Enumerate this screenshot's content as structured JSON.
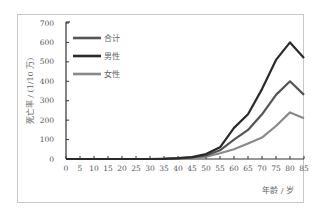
{
  "chart_data": {
    "type": "line",
    "title": "",
    "xlabel": "年龄 / 岁",
    "ylabel": "死亡率 / (1/10 万)",
    "x": [
      0,
      5,
      10,
      15,
      20,
      25,
      30,
      35,
      40,
      45,
      50,
      55,
      60,
      65,
      70,
      75,
      80,
      85
    ],
    "xticks": [
      "0",
      "5",
      "10",
      "15",
      "20",
      "25",
      "30",
      "35",
      "40",
      "45",
      "50",
      "55",
      "60",
      "65",
      "70",
      "75",
      "80",
      "85"
    ],
    "yticks": [
      "0",
      "100",
      "200",
      "300",
      "400",
      "500",
      "600",
      "700"
    ],
    "ylim": [
      0,
      700
    ],
    "xlim": [
      0,
      85
    ],
    "grid": false,
    "legend_position": "upper-left",
    "series": [
      {
        "name": "合计",
        "color": "#555555",
        "values": [
          0,
          0,
          0,
          0,
          0,
          0,
          0,
          1,
          3,
          8,
          18,
          45,
          100,
          150,
          230,
          330,
          400,
          330
        ]
      },
      {
        "name": "男性",
        "color": "#2a2a2a",
        "values": [
          0,
          0,
          0,
          0,
          0,
          0,
          0,
          1,
          4,
          10,
          25,
          60,
          160,
          230,
          360,
          510,
          600,
          520
        ]
      },
      {
        "name": "女性",
        "color": "#8a8a8a",
        "values": [
          0,
          0,
          0,
          0,
          0,
          0,
          0,
          1,
          2,
          6,
          12,
          30,
          50,
          80,
          110,
          170,
          240,
          210
        ]
      }
    ]
  }
}
